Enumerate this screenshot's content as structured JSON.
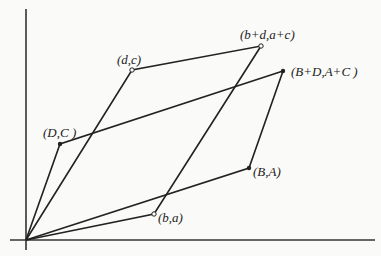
{
  "diagram": {
    "type": "parallelograms-on-axes",
    "origin": {
      "x": 26,
      "y": 240
    },
    "axes": {
      "y_top": 9,
      "x_left": 10,
      "x_right": 375
    },
    "points": {
      "DC": {
        "x": 60,
        "y": 144,
        "label": "(D,C )",
        "marker": "filled"
      },
      "dc": {
        "x": 132,
        "y": 70,
        "label": "(d,c)",
        "marker": "open"
      },
      "bdac": {
        "x": 261,
        "y": 46,
        "label": "(b+d,a+c)",
        "marker": "open"
      },
      "BDAC": {
        "x": 283,
        "y": 71,
        "label": "(B+D,A+C )",
        "marker": "filled"
      },
      "BA": {
        "x": 249,
        "y": 168,
        "label": "(B,A)",
        "marker": "filled"
      },
      "ba": {
        "x": 154,
        "y": 214,
        "label": "(b,a)",
        "marker": "open"
      }
    },
    "colors": {
      "line": "#222222",
      "background": "#fafaf8"
    }
  }
}
